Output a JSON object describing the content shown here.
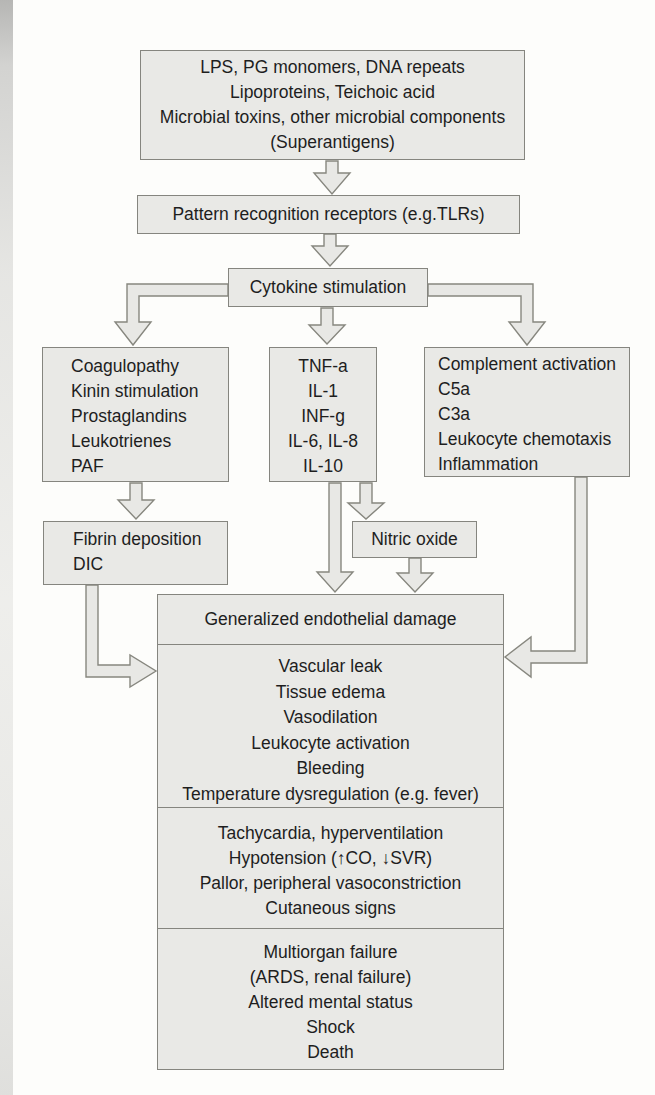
{
  "colors": {
    "page_bg": "#fdfdfb",
    "box_fill": "#e9e9e6",
    "box_border": "#85857f",
    "arrow_fill": "#e8e8e5",
    "arrow_stroke": "#87877f",
    "text_color": "#1e1e1e"
  },
  "boxes": {
    "microbial_triggers": {
      "lines": [
        "LPS, PG monomers, DNA repeats",
        "Lipoproteins, Teichoic acid",
        "Microbial toxins, other microbial components",
        "(Superantigens)"
      ]
    },
    "pattern_recognition": {
      "lines": [
        "Pattern recognition receptors (e.g.TLRs)"
      ]
    },
    "cytokine_stimulation": {
      "lines": [
        "Cytokine stimulation"
      ]
    },
    "coagulation_mediators": {
      "lines": [
        "Coagulopathy",
        "Kinin stimulation",
        "Prostaglandins",
        "Leukotrienes",
        "PAF"
      ]
    },
    "cytokines": {
      "lines": [
        "TNF-a",
        "IL-1",
        "INF-g",
        "IL-6, IL-8",
        "IL-10"
      ]
    },
    "complement_activation": {
      "lines": [
        "Complement activation",
        "C5a",
        "C3a",
        "Leukocyte chemotaxis",
        "Inflammation"
      ]
    },
    "fibrin_dic": {
      "lines": [
        "Fibrin deposition",
        "DIC"
      ]
    },
    "nitric_oxide": {
      "lines": [
        "Nitric oxide"
      ]
    },
    "endothelial_damage": {
      "lines": [
        "Generalized endothelial damage"
      ]
    },
    "endothelial_effects": {
      "lines": [
        "Vascular leak",
        "Tissue edema",
        "Vasodilation",
        "Leukocyte activation",
        "Bleeding",
        "Temperature dysregulation (e.g. fever)"
      ]
    },
    "hemodynamic_signs": {
      "lines": [
        "Tachycardia, hyperventilation",
        "Hypotension (↑CO, ↓SVR)",
        "Pallor, peripheral vasoconstriction",
        "Cutaneous signs"
      ]
    },
    "outcomes": {
      "lines": [
        "Multiorgan failure",
        "(ARDS, renal failure)",
        "Altered mental status",
        "Shock",
        "Death"
      ]
    }
  }
}
